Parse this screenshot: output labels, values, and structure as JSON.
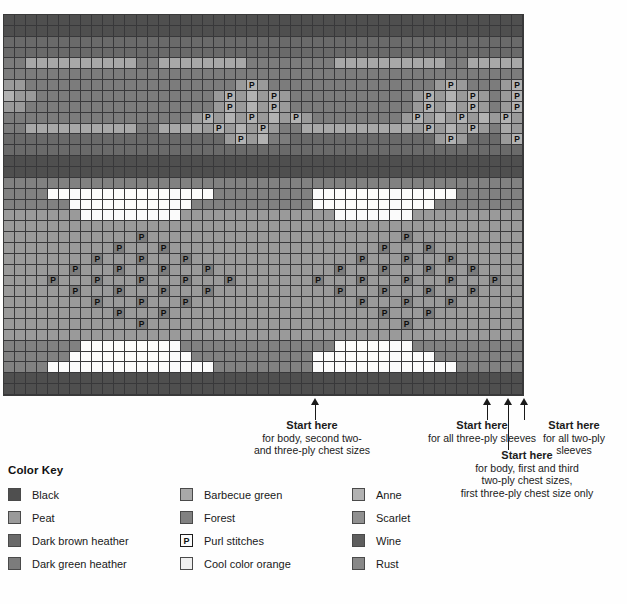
{
  "chart": {
    "columns": 47,
    "rows": 35,
    "palette": {
      "black": "#4f4f4f",
      "peat": "#9a9a9a",
      "dark_brown_heather": "#6a6a6a",
      "dark_green_heather": "#7c7c7c",
      "barbecue_green": "#a8a8a8",
      "forest": "#818181",
      "cool_color_orange": "#efefef",
      "anne": "#b2b2b2",
      "scarlet": "#909090",
      "wine": "#5e5e5e",
      "rust": "#888888",
      "white_band": "#fbfbfb",
      "grid_line": "#38383a"
    },
    "purl_symbol": "P"
  },
  "annotations": [
    {
      "id": "start-here-body-second",
      "header": "Start here",
      "lines": [
        "for body, second two-",
        "and three-ply chest sizes"
      ],
      "arrow_x": 311,
      "arrow_top": 398,
      "arrow_height": 22,
      "note_left": 238,
      "note_top": 419,
      "note_width": 148
    },
    {
      "id": "start-here-all-three-ply-sleeves",
      "header": "Start here",
      "lines": [
        "for all three-ply sleeves"
      ],
      "arrow_x": 483,
      "arrow_top": 398,
      "arrow_height": 22,
      "note_left": 382,
      "note_top": 419,
      "note_width": 200
    },
    {
      "id": "start-here-body-first-third",
      "header": "Start here",
      "lines": [
        "for body, first and third",
        "two-ply chest sizes,",
        "first three-ply chest size only"
      ],
      "arrow_x": 504,
      "arrow_top": 398,
      "arrow_height": 52,
      "note_left": 432,
      "note_top": 449,
      "note_width": 190
    },
    {
      "id": "start-here-all-two-ply-sleeves",
      "header": "Start here",
      "lines": [
        "for all two-ply sleeves"
      ],
      "arrow_x": 520,
      "arrow_top": 398,
      "arrow_height": 22,
      "note_left": 524,
      "note_top": 419,
      "note_width": 100
    }
  ],
  "color_key": {
    "title": "Color Key",
    "columns": [
      [
        {
          "label": "Black",
          "color": "#4f4f4f",
          "symbol": ""
        },
        {
          "label": "Peat",
          "color": "#9a9a9a",
          "symbol": ""
        },
        {
          "label": "Dark brown heather",
          "color": "#6a6a6a",
          "symbol": ""
        },
        {
          "label": "Dark green heather",
          "color": "#7c7c7c",
          "symbol": ""
        }
      ],
      [
        {
          "label": "Barbecue green",
          "color": "#a8a8a8",
          "symbol": ""
        },
        {
          "label": "Forest",
          "color": "#818181",
          "symbol": ""
        },
        {
          "label": "Purl stitches",
          "color": "#fbfbfb",
          "symbol": "P"
        },
        {
          "label": "Cool color orange",
          "color": "#efefef",
          "symbol": ""
        }
      ],
      [
        {
          "label": "Anne",
          "color": "#b2b2b2",
          "symbol": ""
        },
        {
          "label": "Scarlet",
          "color": "#909090",
          "symbol": ""
        },
        {
          "label": "Wine",
          "color": "#5e5e5e",
          "symbol": ""
        },
        {
          "label": "Rust",
          "color": "#888888",
          "symbol": ""
        }
      ]
    ]
  },
  "chart_data": {
    "type": "heatmap",
    "title": "",
    "xlabel": "",
    "ylabel": "",
    "grid": true,
    "legend": "bottom",
    "note": "Fair-isle knitting colorwork chart: 47 stitch columns x 35 rows. Cell codes map to palette keys; 'P' marks purl stitches.",
    "row_codes": [
      "DDDDDDDDDDDDDDDDDDDDDDDDDDDDDDDDDDDDDDDDDDDDDDD",
      "DDDDDDDDDDDDDDDDDDDDDDDDDDDDDDDDDDDDDDDDDDDDDDD",
      "HHHHHHHHHHHHHHHHHHHHHHHHHHHHHHHHHHHHHHHHHHHHHHH",
      "HHHHHHHHHHHHHHHHHHHHHHHHHHHHHHHHHHHHHHHHHHHHHHH",
      "GGBBBBBBBBBBGGBBBBBBBBGGGGGGGGBBBBBBBBBBGGBBBBB",
      "GGGGGGGGGGGGGGGGGGGGGGGGGGGGGGGGGGGGGGGGGGGGGGG",
      "ppGGGGGGGGGGGGGGGGGGGpPpGGGGGGGGGGGGGGGpPpGGGpP",
      "AppGGGGGGGGGGGGGGGGpPpApPpGGGGGGGGGGGpPpApPpGpPp",
      "ppGGGGGGGGGGGGGGGGGpPpApPpGGGGGGGGGGGpPpApPpGpPp",
      "GGGGGGGGGGGGGGGGGpPpApPpApPpGGGGGGGGpPpApPpApPpA",
      "GGBBBBBBBBBBGGBBBBpPpApPpGGBBBBBBBBBBpPpApPpGBpP",
      "HHHHHHHHHHHHHHHHHHHHpPpAGGHHHHHHHHHHHHHpPpHHHpP",
      "HHHHHHHHHHHHHHHHHHHHHHHHHHHHHHHHHHHHHHHHHHHHHHH",
      "DDDDDDDDDDDDDDDDDDDDDDDDDDDDDDDDDDDDDDDDDDDDDDD",
      "DDDDDDDDDDDDDDDDDDDDDDDDDDDDDDDDDDDDDDDDDDDDDDD",
      "KKKKKKKKKKKKKKKKKKKKKKKKKKKKKKKKKKKKKKKKKKKKKKK",
      "KKKKWWWWWWWWWWWWWWWKKKKKKKKKWWWWWWWWWWWWWKKKKKK",
      "KKKKKKWWWWWWWWWWWKKKKKKKKKKKWWWWWWWWWWWKKKKKKKK",
      "SSSSSSSWWWWWWWWWSSSSSSSSSSSSSSWWWWWWWSSSSSSSSSS",
      "SSSSSSSSSSSSSSSSSSSSSSSSSSSSSSSSSSSSSSSSSSSSSSS",
      "SSSSSSSSSSSpPpSSSSSSSSSSSSSSSSSSSSSpPpSSSSSSSSS",
      "SSSSSSSSSpPpSpPpSSSSSSSSSSSSSSSSSpPpSpPpSSSSSSS",
      "SSSSSSSpPpSpPpSpPpSSSSSSSSSSSSSpPpSpPpSpPpSSSSS",
      "SSSSSpPpSpPpSpPpSpPpSSSSSSSSSpPpSpPpSpPpSpPpSSS",
      "SSSpPpSpPpSpPpSpPpSpPpSSSSSpPpSpPpSpPpSpPpSpPpS",
      "SSSSSpPpSpPpSpPpSpPpSSSSSSSSSpPpSpPpSpPpSpPpSSS",
      "SSSSSSSpPpSpPpSpPpSSSSSSSSSSSSSpPpSpPpSpPpSSSSS",
      "SSSSSSSSSpPpSpPpSSSSSSSSSSSSSSSSSpPpSpPpSSSSSSS",
      "SSSSSSSSSSSpPpSSSSSSSSSSSSSSSSSSSSSpPpSSSSSSSSS",
      "SSSSSSSSSSSSSSSSSSSSSSSSSSSSSSSSSSSSSSSSSSSSSSS",
      "KKKKKKKWWWWWWWWWKKKKKKKKKKKKKKWWWWWWWKKKKKKKKKK",
      "KKKKKKWWWWWWWWWWWKKKKKKKKKKKWWWWWWWWWWWKKKKKKKK",
      "KKKKWWWWWWWWWWWWWWWKKKKKKKKKWWWWWWWWWWWWWKKKKKK",
      "DDDDDDDDDDDDDDDDDDDDDDDDDDDDDDDDDDDDDDDDDDDDDDD",
      "DDDDDDDDDDDDDDDDDDDDDDDDDDDDDDDDDDDDDDDDDDDDDDD"
    ],
    "code_legend": {
      "D": "black",
      "H": "dark_brown_heather",
      "G": "dark_green_heather",
      "B": "barbecue_green",
      "A": "anne",
      "K": "forest",
      "W": "white_band",
      "S": "peat",
      "p": "purl-on-peat",
      "P": "purl-on-anne"
    }
  }
}
